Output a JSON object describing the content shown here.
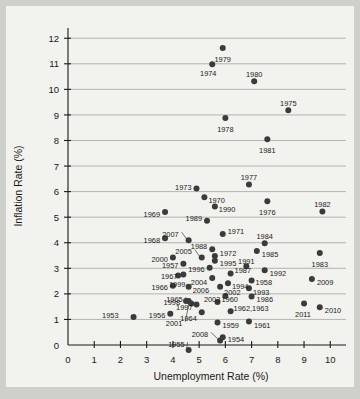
{
  "chart_data": {
    "type": "scatter",
    "title": "",
    "xlabel": "Unemployment Rate (%)",
    "ylabel": "Inflation Rate (%)",
    "xlim": [
      0,
      10.6
    ],
    "ylim": [
      0,
      12.4
    ],
    "xticks": [
      "0",
      "1",
      "2",
      "3",
      "4",
      "5",
      "6",
      "7",
      "8",
      "9",
      "10"
    ],
    "yticks": [
      "0",
      "1",
      "2",
      "3",
      "4",
      "5",
      "6",
      "7",
      "8",
      "9",
      "10",
      "11",
      "12"
    ],
    "grid": "horizontal",
    "legend": "none",
    "marker_color": "#3b3b3b",
    "points": [
      {
        "label": "1953",
        "x": 2.5,
        "y": 1.1,
        "lx": -15,
        "ly": -1,
        "anchor": "end"
      },
      {
        "label": "1954",
        "x": 5.9,
        "y": 0.3,
        "lx": 5,
        "ly": 2,
        "anchor": "start"
      },
      {
        "label": "1955",
        "x": 4.6,
        "y": -0.2,
        "lx": -4,
        "ly": -6,
        "anchor": "end",
        "leader": true
      },
      {
        "label": "1956",
        "x": 3.9,
        "y": 1.22,
        "lx": -5,
        "ly": 2,
        "anchor": "end"
      },
      {
        "label": "1957",
        "x": 4.4,
        "y": 3.18,
        "lx": -5,
        "ly": 2,
        "anchor": "end"
      },
      {
        "label": "1958",
        "x": 7.0,
        "y": 2.52,
        "lx": 4,
        "ly": 2,
        "anchor": "start"
      },
      {
        "label": "1959",
        "x": 5.7,
        "y": 0.88,
        "lx": 5,
        "ly": 3,
        "anchor": "start"
      },
      {
        "label": "1960",
        "x": 5.7,
        "y": 1.68,
        "lx": 4,
        "ly": -3,
        "anchor": "start"
      },
      {
        "label": "1961",
        "x": 6.9,
        "y": 0.92,
        "lx": 5,
        "ly": 4,
        "anchor": "start"
      },
      {
        "label": "1962,1963",
        "x": 6.2,
        "y": 1.32,
        "lx": 3,
        "ly": -3,
        "anchor": "start"
      },
      {
        "label": "1964",
        "x": 5.1,
        "y": 1.28,
        "lx": -5,
        "ly": 6,
        "anchor": "end"
      },
      {
        "label": "1965",
        "x": 4.6,
        "y": 1.72,
        "lx": -6,
        "ly": -2,
        "anchor": "end",
        "leader": true
      },
      {
        "label": "1966",
        "x": 4.0,
        "y": 2.32,
        "lx": -5,
        "ly": 2,
        "anchor": "end"
      },
      {
        "label": "1967",
        "x": 4.4,
        "y": 2.76,
        "lx": -6,
        "ly": 2,
        "anchor": "end"
      },
      {
        "label": "1968",
        "x": 3.7,
        "y": 4.18,
        "lx": -5,
        "ly": 2,
        "anchor": "end"
      },
      {
        "label": "1969",
        "x": 3.7,
        "y": 5.2,
        "lx": -5,
        "ly": 2,
        "anchor": "end"
      },
      {
        "label": "1970",
        "x": 5.2,
        "y": 5.78,
        "lx": 4,
        "ly": 3,
        "anchor": "start"
      },
      {
        "label": "1971",
        "x": 5.9,
        "y": 4.34,
        "lx": 5,
        "ly": -3,
        "anchor": "start"
      },
      {
        "label": "1972",
        "x": 5.6,
        "y": 3.48,
        "lx": 5,
        "ly": -3,
        "anchor": "start"
      },
      {
        "label": "1973",
        "x": 4.9,
        "y": 6.12,
        "lx": -5,
        "ly": -1,
        "anchor": "end"
      },
      {
        "label": "1974",
        "x": 5.5,
        "y": 10.98,
        "lx": -4,
        "ly": 9,
        "anchor": "middle"
      },
      {
        "label": "1975",
        "x": 8.4,
        "y": 9.18,
        "lx": 0,
        "ly": -7,
        "anchor": "middle"
      },
      {
        "label": "1976",
        "x": 7.6,
        "y": 5.62,
        "lx": 0,
        "ly": 11,
        "anchor": "middle"
      },
      {
        "label": "1977",
        "x": 6.9,
        "y": 6.28,
        "lx": 0,
        "ly": -7,
        "anchor": "middle"
      },
      {
        "label": "1978",
        "x": 6.0,
        "y": 8.88,
        "lx": 0,
        "ly": 11,
        "anchor": "middle"
      },
      {
        "label": "1979",
        "x": 5.9,
        "y": 11.62,
        "lx": 0,
        "ly": 11,
        "anchor": "middle"
      },
      {
        "label": "1980",
        "x": 7.1,
        "y": 10.32,
        "lx": 0,
        "ly": -7,
        "anchor": "middle"
      },
      {
        "label": "1981",
        "x": 7.6,
        "y": 8.05,
        "lx": 0,
        "ly": 11,
        "anchor": "middle"
      },
      {
        "label": "1982",
        "x": 9.7,
        "y": 5.22,
        "lx": 0,
        "ly": -7,
        "anchor": "middle"
      },
      {
        "label": "1983",
        "x": 9.6,
        "y": 3.6,
        "lx": 0,
        "ly": 11,
        "anchor": "middle"
      },
      {
        "label": "1984",
        "x": 7.5,
        "y": 3.98,
        "lx": 0,
        "ly": -7,
        "anchor": "middle"
      },
      {
        "label": "1985",
        "x": 7.2,
        "y": 3.68,
        "lx": 5,
        "ly": 3,
        "anchor": "start"
      },
      {
        "label": "1986",
        "x": 7.0,
        "y": 1.9,
        "lx": 5,
        "ly": 3,
        "anchor": "start"
      },
      {
        "label": "1987",
        "x": 6.2,
        "y": 2.8,
        "lx": 4,
        "ly": -3,
        "anchor": "start"
      },
      {
        "label": "1988",
        "x": 5.5,
        "y": 3.75,
        "lx": -5,
        "ly": -3,
        "anchor": "end"
      },
      {
        "label": "1989",
        "x": 5.3,
        "y": 4.86,
        "lx": -5,
        "ly": -2,
        "anchor": "end"
      },
      {
        "label": "1990",
        "x": 5.6,
        "y": 5.42,
        "lx": 4,
        "ly": 3,
        "anchor": "start"
      },
      {
        "label": "1991",
        "x": 6.8,
        "y": 3.08,
        "lx": 0,
        "ly": -5,
        "anchor": "middle"
      },
      {
        "label": "1992",
        "x": 7.5,
        "y": 2.92,
        "lx": 5,
        "ly": 3,
        "anchor": "start"
      },
      {
        "label": "1993",
        "x": 6.9,
        "y": 2.22,
        "lx": 4,
        "ly": 4,
        "anchor": "start"
      },
      {
        "label": "1994",
        "x": 6.1,
        "y": 2.42,
        "lx": 4,
        "ly": 3,
        "anchor": "start"
      },
      {
        "label": "1995",
        "x": 5.6,
        "y": 3.3,
        "lx": 5,
        "ly": 3,
        "anchor": "start"
      },
      {
        "label": "1996",
        "x": 5.4,
        "y": 3.02,
        "lx": -5,
        "ly": 2,
        "anchor": "end"
      },
      {
        "label": "1997",
        "x": 4.9,
        "y": 1.58,
        "lx": -4,
        "ly": 3,
        "anchor": "end"
      },
      {
        "label": "1998",
        "x": 4.5,
        "y": 1.72,
        "lx": -6,
        "ly": 1,
        "anchor": "end"
      },
      {
        "label": "1999",
        "x": 4.2,
        "y": 2.72,
        "lx": -1,
        "ly": 9,
        "anchor": "middle"
      },
      {
        "label": "2000",
        "x": 4.0,
        "y": 3.42,
        "lx": -5,
        "ly": 2,
        "anchor": "end"
      },
      {
        "label": "2001",
        "x": 4.7,
        "y": 1.62,
        "lx": -9,
        "ly": 20,
        "anchor": "end",
        "leader": true
      },
      {
        "label": "2002",
        "x": 5.8,
        "y": 2.28,
        "lx": 4,
        "ly": 6,
        "anchor": "start"
      },
      {
        "label": "2003",
        "x": 6.0,
        "y": 1.92,
        "lx": -5,
        "ly": 3,
        "anchor": "end"
      },
      {
        "label": "2004",
        "x": 5.5,
        "y": 2.62,
        "lx": -5,
        "ly": 4,
        "anchor": "end"
      },
      {
        "label": "2005",
        "x": 5.1,
        "y": 3.42,
        "lx": -10,
        "ly": -6,
        "anchor": "end",
        "leader": true
      },
      {
        "label": "2006",
        "x": 4.6,
        "y": 2.28,
        "lx": 4,
        "ly": 4,
        "anchor": "start"
      },
      {
        "label": "2007",
        "x": 4.6,
        "y": 4.1,
        "lx": -10,
        "ly": -6,
        "anchor": "end",
        "leader": true
      },
      {
        "label": "2008",
        "x": 5.8,
        "y": 0.18,
        "lx": -12,
        "ly": -6,
        "anchor": "end",
        "leader": true
      },
      {
        "label": "2009",
        "x": 9.3,
        "y": 2.58,
        "lx": 5,
        "ly": 3,
        "anchor": "start"
      },
      {
        "label": "2010",
        "x": 9.6,
        "y": 1.48,
        "lx": 5,
        "ly": 3,
        "anchor": "start"
      },
      {
        "label": "2011",
        "x": 9.0,
        "y": 1.62,
        "lx": -1,
        "ly": 11,
        "anchor": "middle"
      }
    ]
  }
}
